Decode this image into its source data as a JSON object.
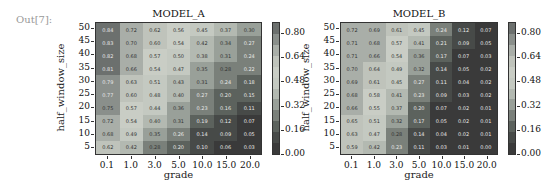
{
  "cell_label": "Out[7]:",
  "chart_data": [
    {
      "type": "heatmap",
      "title": "MODEL_A",
      "xlabel": "grade",
      "ylabel": "half_window_size",
      "x": [
        "0.1",
        "1.0",
        "3.0",
        "5.0",
        "10.0",
        "15.0",
        "20.0"
      ],
      "y": [
        "50",
        "45",
        "40",
        "35",
        "30",
        "25",
        "20",
        "15",
        "10",
        "5"
      ],
      "values": [
        [
          0.84,
          0.72,
          0.62,
          0.56,
          0.45,
          0.37,
          0.3
        ],
        [
          0.83,
          0.7,
          0.6,
          0.54,
          0.42,
          0.34,
          0.27
        ],
        [
          0.82,
          0.68,
          0.57,
          0.5,
          0.38,
          0.31,
          0.24
        ],
        [
          0.81,
          0.66,
          0.54,
          0.47,
          0.35,
          0.28,
          0.22
        ],
        [
          0.79,
          0.63,
          0.51,
          0.43,
          0.31,
          0.24,
          0.18
        ],
        [
          0.77,
          0.6,
          0.48,
          0.4,
          0.27,
          0.2,
          0.15
        ],
        [
          0.75,
          0.57,
          0.44,
          0.36,
          0.23,
          0.16,
          0.11
        ],
        [
          0.72,
          0.54,
          0.4,
          0.31,
          0.19,
          0.12,
          0.07
        ],
        [
          0.68,
          0.49,
          0.35,
          0.26,
          0.14,
          0.09,
          0.05
        ],
        [
          0.62,
          0.42,
          0.28,
          0.2,
          0.1,
          0.06,
          0.03
        ]
      ],
      "colorbar_ticks": [
        "0.80",
        "0.64",
        "0.48",
        "0.32",
        "0.16",
        "0.00"
      ],
      "vmin": 0.0,
      "vmax": 0.88
    },
    {
      "type": "heatmap",
      "title": "MODEL_B",
      "xlabel": "grade",
      "ylabel": "half_window_size",
      "x": [
        "0.1",
        "1.0",
        "3.0",
        "5.0",
        "10.0",
        "15.0",
        "20.0"
      ],
      "y": [
        "50",
        "45",
        "40",
        "35",
        "30",
        "25",
        "20",
        "15",
        "10",
        "5"
      ],
      "values": [
        [
          0.72,
          0.69,
          0.61,
          0.45,
          0.24,
          0.12,
          0.07
        ],
        [
          0.71,
          0.68,
          0.57,
          0.41,
          0.21,
          0.09,
          0.05
        ],
        [
          0.71,
          0.66,
          0.54,
          0.36,
          0.17,
          0.07,
          0.03
        ],
        [
          0.7,
          0.64,
          0.49,
          0.32,
          0.14,
          0.05,
          0.02
        ],
        [
          0.69,
          0.61,
          0.45,
          0.27,
          0.11,
          0.04,
          0.02
        ],
        [
          0.68,
          0.58,
          0.41,
          0.23,
          0.09,
          0.03,
          0.02
        ],
        [
          0.66,
          0.55,
          0.37,
          0.2,
          0.07,
          0.02,
          0.01
        ],
        [
          0.65,
          0.51,
          0.32,
          0.17,
          0.05,
          0.02,
          0.01
        ],
        [
          0.63,
          0.47,
          0.28,
          0.14,
          0.04,
          0.02,
          0.01
        ],
        [
          0.59,
          0.42,
          0.23,
          0.11,
          0.03,
          0.01,
          0.0
        ]
      ],
      "colorbar_ticks": [
        "0.80",
        "0.64",
        "0.48",
        "0.32",
        "0.16",
        "0.00"
      ],
      "vmin": 0.0,
      "vmax": 0.88
    }
  ],
  "colormap": [
    "#3a3a3a",
    "#474a48",
    "#5c625d",
    "#7a807a",
    "#99a099",
    "#b3b9b1",
    "#c4c9c1",
    "#c9cdc5",
    "#bfc3bb",
    "#a9aea8",
    "#8a8f8b",
    "#6c706e"
  ]
}
